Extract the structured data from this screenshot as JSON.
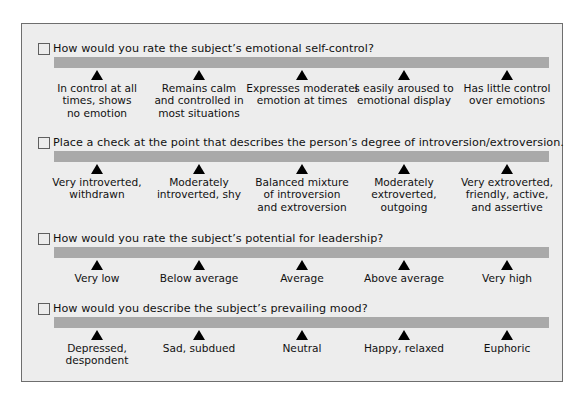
{
  "questions": [
    {
      "prompt": "How would you rate the subject’s emotional self-control?",
      "options": [
        "In control at all\ntimes, shows\nno emotion",
        "Remains calm\nand controlled in\nmost situations",
        "Expresses moderatel\nemotion at times",
        "s easily aroused to\nemotional display",
        "Has little control\nover emotions"
      ]
    },
    {
      "prompt": "Place a check at the point that describes the person’s degree of introversion/extroversion.",
      "options": [
        "Very introverted,\nwithdrawn",
        "Moderately\nintroverted, shy",
        "Balanced mixture\nof introversion\nand extroversion",
        "Moderately\nextroverted,\noutgoing",
        "Very extroverted,\nfriendly, active,\nand assertive"
      ]
    },
    {
      "prompt": "How would you rate the subject’s potential for leadership?",
      "options": [
        "Very low",
        "Below average",
        "Average",
        "Above average",
        "Very high"
      ]
    },
    {
      "prompt": "How would you describe the subject’s prevailing mood?",
      "options": [
        "Depressed,\ndespondent",
        "Sad, subdued",
        "Neutral",
        "Happy, relaxed",
        "Euphoric"
      ]
    }
  ],
  "colors": {
    "panel_bg": "#ededed",
    "panel_border": "#6e6e6e",
    "scale_bar": "#a9a9a9",
    "marker": "#000000"
  }
}
